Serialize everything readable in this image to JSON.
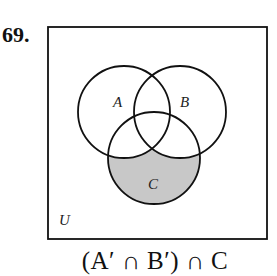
{
  "problem": {
    "number": "69.",
    "expression": "(A′ ∩ B′) ∩ C"
  },
  "diagram": {
    "universe_label": "U",
    "sets": [
      {
        "label": "A",
        "cx": 124,
        "cy": 112,
        "r": 46
      },
      {
        "label": "B",
        "cx": 180,
        "cy": 112,
        "r": 46
      },
      {
        "label": "C",
        "cx": 154,
        "cy": 158,
        "r": 46
      }
    ],
    "shaded_region": "C only (outside A and B)",
    "shade_color": "#c8c8c8",
    "stroke_color": "#111111"
  }
}
